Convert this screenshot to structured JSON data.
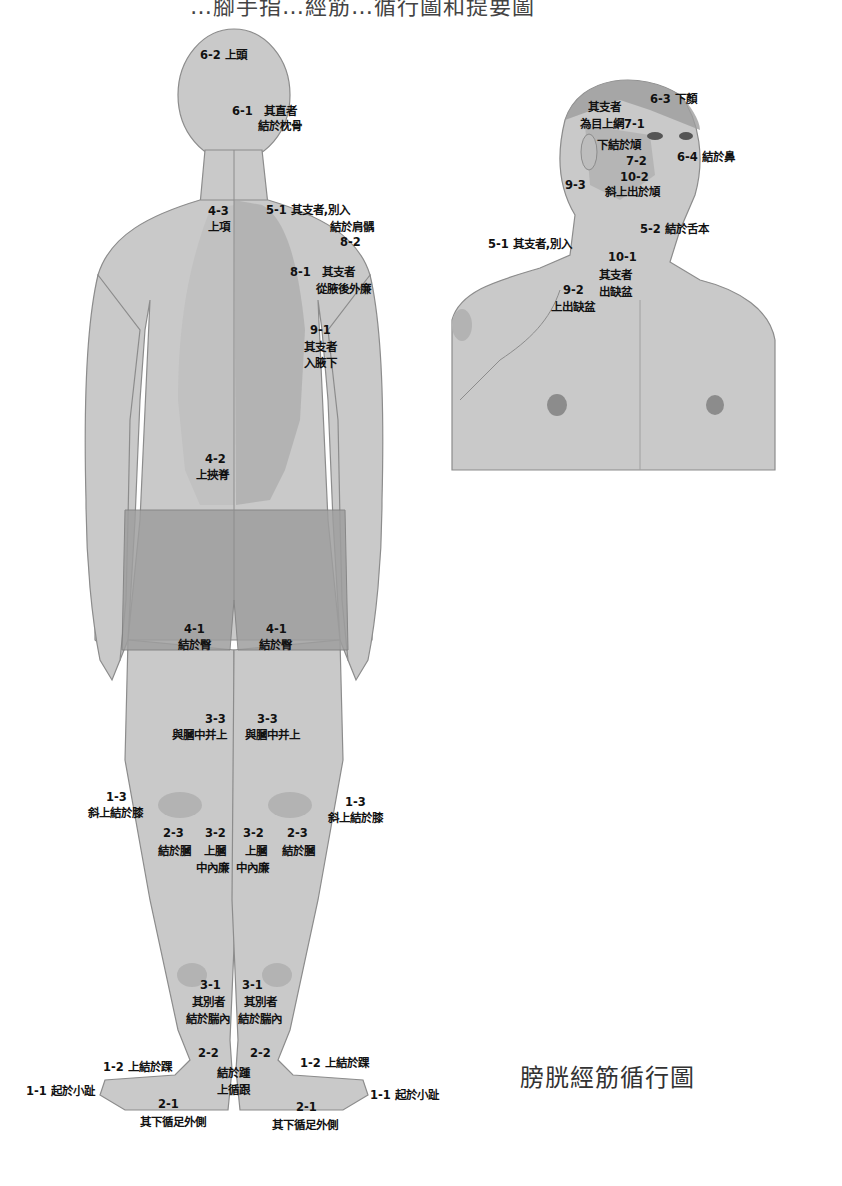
{
  "header": {
    "title_partial": "…腳手指…經筋…循行圖和提要圖"
  },
  "caption": "膀胱經筋循行圖",
  "colors": {
    "body_fill": "#c9c9c9",
    "body_shadow": "#b3b3b3",
    "meridian_zone": "#a9a9a9",
    "shorts": "#9e9e9e",
    "outline": "#8c8c8c",
    "text": "#111111",
    "background": "#ffffff"
  },
  "back_figure": {
    "labels": [
      {
        "id": "6-2",
        "code": "6-2",
        "text": "上頭"
      },
      {
        "id": "6-1",
        "code": "6-1",
        "text": "其直者\n結於枕骨"
      },
      {
        "id": "4-3",
        "code": "4-3",
        "text": "上項"
      },
      {
        "id": "5-1",
        "code": "5-1",
        "text": "其支者,別入\n結於肩髃"
      },
      {
        "id": "8-2",
        "code": "8-2",
        "text": ""
      },
      {
        "id": "8-1",
        "code": "8-1",
        "text": "其支者\n從腋後外廉"
      },
      {
        "id": "9-1",
        "code": "9-1",
        "text": "其支者\n入腋下"
      },
      {
        "id": "4-2",
        "code": "4-2",
        "text": "上挾脊"
      },
      {
        "id": "4-1-l",
        "code": "4-1",
        "text": "結於臀"
      },
      {
        "id": "4-1-r",
        "code": "4-1",
        "text": "結於臀"
      },
      {
        "id": "3-3-l",
        "code": "3-3",
        "text": "與膕中并上"
      },
      {
        "id": "3-3-r",
        "code": "3-3",
        "text": "與膕中并上"
      },
      {
        "id": "1-3-l",
        "code": "1-3",
        "text": "斜上結於膝"
      },
      {
        "id": "1-3-r",
        "code": "1-3",
        "text": "斜上結於膝"
      },
      {
        "id": "2-3-l",
        "code": "2-3",
        "text": "結於膕"
      },
      {
        "id": "3-2-l",
        "code": "3-2",
        "text": "上膕\n中內廉"
      },
      {
        "id": "3-2-r",
        "code": "3-2",
        "text": "上膕\n中內廉"
      },
      {
        "id": "2-3-r",
        "code": "2-3",
        "text": "結於膕"
      },
      {
        "id": "3-1-l",
        "code": "3-1",
        "text": "其別者\n結於腨內"
      },
      {
        "id": "3-1-r",
        "code": "3-1",
        "text": "其別者\n結於腨內"
      },
      {
        "id": "2-2-l",
        "code": "2-2",
        "text": ""
      },
      {
        "id": "2-2-r",
        "code": "2-2",
        "text": "結於踵\n上循跟"
      },
      {
        "id": "1-2-l",
        "code": "1-2",
        "text": "上結於踝"
      },
      {
        "id": "1-2-r",
        "code": "1-2",
        "text": "上結於踝"
      },
      {
        "id": "1-1-l",
        "code": "1-1",
        "text": "起於小趾"
      },
      {
        "id": "1-1-r",
        "code": "1-1",
        "text": "起於小趾"
      },
      {
        "id": "2-1-l",
        "code": "2-1",
        "text": "其下循足外側"
      },
      {
        "id": "2-1-r",
        "code": "2-1",
        "text": "其下循足外側"
      }
    ]
  },
  "front_figure": {
    "labels": [
      {
        "id": "7-1",
        "code": "7-1",
        "text": "其支者\n為目上網"
      },
      {
        "id": "6-3",
        "code": "6-3",
        "text": "下顏"
      },
      {
        "id": "7-2a",
        "code": "",
        "text": "下結於頄"
      },
      {
        "id": "6-4",
        "code": "6-4",
        "text": "結於鼻"
      },
      {
        "id": "7-2",
        "code": "7-2",
        "text": ""
      },
      {
        "id": "10-2",
        "code": "10-2",
        "text": "斜上出於頄"
      },
      {
        "id": "9-3",
        "code": "9-3",
        "text": ""
      },
      {
        "id": "5-2",
        "code": "5-2",
        "text": "結於舌本"
      },
      {
        "id": "5-1f",
        "code": "5-1",
        "text": "其支者,別入"
      },
      {
        "id": "10-1",
        "code": "10-1",
        "text": "其支者\n出缺盆"
      },
      {
        "id": "9-2",
        "code": "9-2",
        "text": "上出缺盆"
      }
    ]
  },
  "text": {
    "b62": "6-2 上頭",
    "b61a": "6-1　其直者",
    "b61b": "結於枕骨",
    "b43a": "4-3",
    "b43b": "上項",
    "b51a": "5-1 其支者,別入",
    "b51b": "結於肩髃",
    "b82": "8-2",
    "b81a": "8-1　其支者",
    "b81b": "從腋後外廉",
    "b91a": "9-1",
    "b91b": "其支者",
    "b91c": "入腋下",
    "b42a": "4-2",
    "b42b": "上挾脊",
    "b41la": "4-1",
    "b41lb": "結於臀",
    "b41ra": "4-1",
    "b41rb": "結於臀",
    "b33la": "3-3",
    "b33lb": "與膕中并上",
    "b33ra": "3-3",
    "b33rb": "與膕中并上",
    "b13la": "1-3",
    "b13lb": "斜上結於膝",
    "b13ra": "1-3",
    "b13rb": "斜上結於膝",
    "b23la": "2-3",
    "b23lb": "結於膕",
    "b32la": "3-2",
    "b32lb": "上膕",
    "b32lc": "中內廉",
    "b32ra": "3-2",
    "b32rb": "上膕",
    "b32rc": "中內廉",
    "b23ra": "2-3",
    "b23rb": "結於膕",
    "b31la": "3-1",
    "b31lb": "其別者",
    "b31lc": "結於腨內",
    "b31ra": "3-1",
    "b31rb": "其別者",
    "b31rc": "結於腨內",
    "b22la": "2-2",
    "b22ra": "2-2",
    "b22rb": "結於踵",
    "b22rc": "上循跟",
    "b12l": "1-2 上結於踝",
    "b12r": "1-2 上結於踝",
    "b11l": "1-1 起於小趾",
    "b11r": "1-1 起於小趾",
    "b21la": "2-1",
    "b21lb": "其下循足外側",
    "b21ra": "2-1",
    "b21rb": "其下循足外側",
    "f71a": "其支者",
    "f71b": "為目上網7-1",
    "f63": "6-3 下顏",
    "f72a": "下結於頄",
    "f64": "6-4 結於鼻",
    "f72": "7-2",
    "f102a": "10-2",
    "f102b": "斜上出於頄",
    "f93": "9-3",
    "f52": "5-2 結於舌本",
    "f51": "5-1 其支者,別入",
    "f101a": "10-1",
    "f101b": "其支者",
    "f101c": "出缺盆",
    "f92a": "9-2",
    "f92b": "上出缺盆"
  }
}
